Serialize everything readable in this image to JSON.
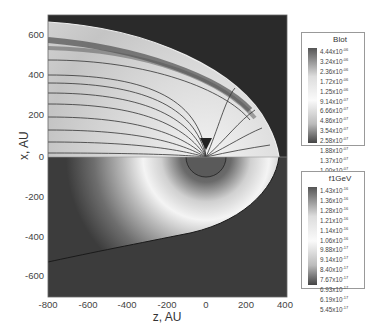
{
  "chart_data": {
    "type": "heatmap",
    "title": "",
    "xlabel": "z, AU",
    "ylabel": "x, AU",
    "xlim": [
      -800,
      400
    ],
    "ylim": [
      -700,
      700
    ],
    "x_ticks": [
      "-800",
      "-600",
      "-400",
      "-200",
      "0",
      "200",
      "400"
    ],
    "y_ticks": [
      "600",
      "400",
      "200",
      "0",
      "-200",
      "-400",
      "-600"
    ],
    "grid": false,
    "panels": [
      {
        "region": "upper half (x > 0)",
        "quantity": "Blot",
        "description": "Grayscale map of total magnetic field with streamlines converging toward origin; bright heliosheath bounded by a heliopause arc reaching z≈280 AU",
        "colorbar": {
          "title": "Blot",
          "levels": [
            "4.44x10^-06",
            "3.24x10^-06",
            "2.36x10^-06",
            "1.72x10^-06",
            "1.25x10^-06",
            "9.14x10^-07",
            "6.66x10^-07",
            "4.86x10^-07",
            "3.54x10^-07",
            "2.58x10^-07",
            "1.88x10^-07",
            "1.37x10^-07",
            "1.00x10^-07"
          ]
        }
      },
      {
        "region": "lower half (x < 0)",
        "quantity": "f1GeV",
        "description": "Grayscale map of 1 GeV distribution; bright ring around origin, dark inner disk radius ≈70 AU, boundary curve from (z≈280,x≈0) to (z≈-800,x≈-530)",
        "colorbar": {
          "title": "f1GeV",
          "levels": [
            "1.43x10^-16",
            "1.36x10^-16",
            "1.28x10^-16",
            "1.21x10^-16",
            "1.14x10^-16",
            "1.06x10^-16",
            "9.88x10^-17",
            "9.14x10^-17",
            "8.40x10^-17",
            "7.67x10^-17",
            "6.93x10^-17",
            "6.19x10^-17",
            "5.45x10^-17"
          ]
        }
      }
    ]
  },
  "axes": {
    "xlabel": "z, AU",
    "ylabel": "x, AU",
    "x_ticks": [
      "-800",
      "-600",
      "-400",
      "-200",
      "0",
      "200",
      "400"
    ],
    "y_ticks": [
      "600",
      "400",
      "200",
      "0",
      "-200",
      "-400",
      "-600"
    ]
  },
  "legends": {
    "blot": {
      "title": "Blot",
      "values": [
        {
          "m": "4.44x10",
          "e": "-06"
        },
        {
          "m": "3.24x10",
          "e": "-06"
        },
        {
          "m": "2.36x10",
          "e": "-06"
        },
        {
          "m": "1.72x10",
          "e": "-06"
        },
        {
          "m": "1.25x10",
          "e": "-06"
        },
        {
          "m": "9.14x10",
          "e": "-07"
        },
        {
          "m": "6.66x10",
          "e": "-07"
        },
        {
          "m": "4.86x10",
          "e": "-07"
        },
        {
          "m": "3.54x10",
          "e": "-07"
        },
        {
          "m": "2.58x10",
          "e": "-07"
        },
        {
          "m": "1.88x10",
          "e": "-07"
        },
        {
          "m": "1.37x10",
          "e": "-07"
        },
        {
          "m": "1.00x10",
          "e": "-07"
        }
      ]
    },
    "f1gev": {
      "title": "f1GeV",
      "values": [
        {
          "m": "1.43x10",
          "e": "-16"
        },
        {
          "m": "1.36x10",
          "e": "-16"
        },
        {
          "m": "1.28x10",
          "e": "-16"
        },
        {
          "m": "1.21x10",
          "e": "-16"
        },
        {
          "m": "1.14x10",
          "e": "-16"
        },
        {
          "m": "1.06x10",
          "e": "-16"
        },
        {
          "m": "9.88x10",
          "e": "-17"
        },
        {
          "m": "9.14x10",
          "e": "-17"
        },
        {
          "m": "8.40x10",
          "e": "-17"
        },
        {
          "m": "7.67x10",
          "e": "-17"
        },
        {
          "m": "6.93x10",
          "e": "-17"
        },
        {
          "m": "6.19x10",
          "e": "-17"
        },
        {
          "m": "5.45x10",
          "e": "-17"
        }
      ]
    }
  }
}
